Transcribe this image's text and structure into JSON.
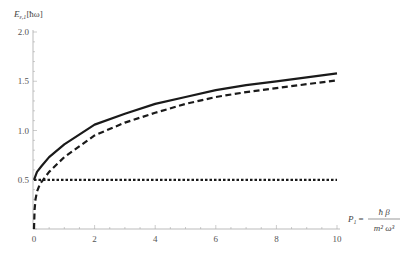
{
  "chart_data": {
    "type": "line",
    "title": "",
    "xlabel": "P_1 = ħβ / (m² ω³)",
    "ylabel": "E_{ε,1}[ħω]",
    "xlim": [
      0,
      10
    ],
    "ylim": [
      0,
      2.0
    ],
    "grid": false,
    "legend": null,
    "x_ticks": [
      "0",
      "2",
      "4",
      "6",
      "8",
      "10"
    ],
    "y_ticks": [
      "0.5",
      "1.0",
      "1.5",
      "2.0"
    ],
    "series": [
      {
        "name": "solid",
        "style": "solid",
        "x": [
          0,
          0.1,
          0.25,
          0.5,
          1,
          2,
          3,
          4,
          5,
          6,
          7,
          8,
          9,
          10
        ],
        "y": [
          0.5,
          0.58,
          0.64,
          0.73,
          0.86,
          1.06,
          1.17,
          1.27,
          1.34,
          1.41,
          1.46,
          1.5,
          1.54,
          1.58
        ]
      },
      {
        "name": "dashed",
        "style": "dashed",
        "x": [
          0,
          0.02,
          0.05,
          0.1,
          0.2,
          0.3,
          0.5,
          1,
          2,
          3,
          4,
          5,
          6,
          7,
          8,
          9,
          10
        ],
        "y": [
          0,
          0.2,
          0.3,
          0.38,
          0.46,
          0.5,
          0.58,
          0.73,
          0.95,
          1.08,
          1.18,
          1.27,
          1.34,
          1.39,
          1.43,
          1.47,
          1.51
        ]
      },
      {
        "name": "dotted",
        "style": "dotted",
        "x": [
          0,
          10
        ],
        "y": [
          0.5,
          0.5
        ]
      }
    ]
  },
  "labels": {
    "y_axis_main": "E",
    "y_axis_sub": "ε,1",
    "y_axis_unit": "[ħω]",
    "x_axis_prefix": "P",
    "x_axis_sub": "1",
    "x_axis_eq": "=",
    "x_axis_num": "ħ β",
    "x_axis_den": "m² ω³"
  }
}
